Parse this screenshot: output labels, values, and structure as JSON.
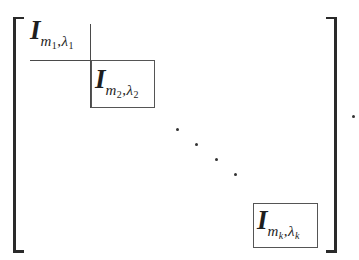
{
  "matrix": {
    "description": "Block diagonal matrix of Jordan-type blocks",
    "blocks": [
      {
        "main": "I",
        "sub_var1": "m",
        "sub_idx1": "1",
        "sep": ",",
        "sub_var2": "λ",
        "sub_idx2": "1"
      },
      {
        "main": "I",
        "sub_var1": "m",
        "sub_idx1": "2",
        "sep": ",",
        "sub_var2": "λ",
        "sub_idx2": "2"
      },
      {
        "main": "I",
        "sub_var1": "m",
        "sub_idx1": "k",
        "sep": ",",
        "sub_var2": "λ",
        "sub_idx2": "k"
      }
    ],
    "diagonal_ellipsis": "· · · ·",
    "trailing_punctuation": "."
  }
}
